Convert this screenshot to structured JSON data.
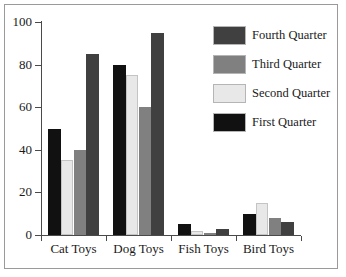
{
  "frame": {
    "border_color": "#9a9a9a",
    "background": "#ffffff"
  },
  "legend": {
    "position": "top-right",
    "entries": [
      {
        "label": "Fourth Quarter",
        "color": "#404040"
      },
      {
        "label": "Third Quarter",
        "color": "#808080"
      },
      {
        "label": "Second Quarter",
        "color": "#e8e8e8"
      },
      {
        "label": "First Quarter",
        "color": "#111111"
      }
    ]
  },
  "axis": {
    "y_ticks": [
      "0",
      "20",
      "40",
      "60",
      "80",
      "100"
    ],
    "y_tick_values": [
      0,
      20,
      40,
      60,
      80,
      100
    ],
    "x_categories": [
      "Cat Toys",
      "Dog Toys",
      "Fish Toys",
      "Bird Toys"
    ]
  },
  "chart_data": {
    "type": "bar",
    "title": "",
    "subtitle": "",
    "xlabel": "",
    "ylabel": "",
    "ylim": [
      0,
      100
    ],
    "grid": false,
    "legend_position": "top-right",
    "orientation": "vertical",
    "grouping": "grouped",
    "categories": [
      "Cat Toys",
      "Dog Toys",
      "Fish Toys",
      "Bird Toys"
    ],
    "series": [
      {
        "name": "First Quarter",
        "color": "#111111",
        "values": [
          50,
          80,
          5,
          10
        ]
      },
      {
        "name": "Second Quarter",
        "color": "#e8e8e8",
        "values": [
          35,
          75,
          2,
          15
        ]
      },
      {
        "name": "Third Quarter",
        "color": "#808080",
        "values": [
          40,
          60,
          1,
          8
        ]
      },
      {
        "name": "Fourth Quarter",
        "color": "#404040",
        "values": [
          85,
          95,
          3,
          6
        ]
      }
    ],
    "legend_order": [
      "Fourth Quarter",
      "Third Quarter",
      "Second Quarter",
      "First Quarter"
    ],
    "axis_ticks": {
      "y": [
        0,
        20,
        40,
        60,
        80,
        100
      ]
    }
  }
}
